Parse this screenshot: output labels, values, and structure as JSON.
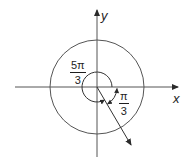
{
  "diagram": {
    "type": "unit-circle-angle",
    "axes": {
      "x_label": "x",
      "y_label": "y"
    },
    "angles": [
      {
        "name": "positive-angle",
        "numerator": "5π",
        "denominator": "3",
        "direction": "counterclockwise"
      },
      {
        "name": "negative-angle",
        "numerator": "π",
        "denominator": "3",
        "direction": "clockwise"
      }
    ],
    "colors": {
      "stroke": "#3a3a3a",
      "background": "#ffffff"
    }
  }
}
